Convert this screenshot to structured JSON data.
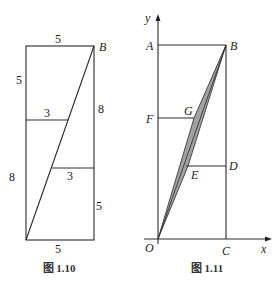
{
  "figure_left": {
    "caption": "图 1.10",
    "labels": {
      "top": "5",
      "left_upper": "5",
      "left_lower": "8",
      "right_upper": "8",
      "right_lower": "5",
      "bottom": "5",
      "mid_upper": "3",
      "mid_lower": "3",
      "vertex_B": "B"
    }
  },
  "figure_right": {
    "caption": "图 1.11",
    "axis": {
      "x": "x",
      "y": "y"
    },
    "points": {
      "A": "A",
      "B": "B",
      "F": "F",
      "G": "G",
      "E": "E",
      "D": "D",
      "O": "O",
      "C": "C"
    }
  }
}
